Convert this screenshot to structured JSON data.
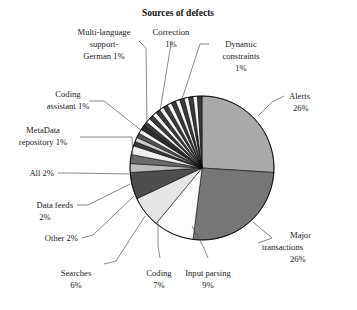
{
  "chart_data": {
    "type": "pie",
    "title": "Sources of defects",
    "subtitle": "",
    "xlabel": "",
    "ylabel": "",
    "legend_position": "none",
    "grid": false,
    "value_unit": "%",
    "start_angle_deg": 0,
    "direction": "clockwise",
    "labels": [
      "Alerts",
      "Major transactions",
      "Input parsing",
      "Coding",
      "Searches",
      "Other",
      "Data feeds",
      "All",
      "MetaData repository",
      "Coding assistant",
      "Multi-language support-German",
      "Correction",
      "Dynamic constraints"
    ],
    "values": [
      26,
      26,
      9,
      7,
      6,
      2,
      2,
      2,
      1,
      1,
      1,
      1,
      1
    ],
    "slices": [
      {
        "label": "Alerts",
        "value": 26,
        "display": "Alerts\n26%",
        "color": "#a9a9a9"
      },
      {
        "label": "Major transactions",
        "value": 26,
        "display": "Major\ntransactions\n26%",
        "color": "#767676"
      },
      {
        "label": "Input parsing",
        "value": 9,
        "display": "Input parsing\n9%",
        "color": "#fdfdfd"
      },
      {
        "label": "Coding",
        "value": 7,
        "display": "Coding\n7%",
        "color": "#e6e6e6"
      },
      {
        "label": "Searches",
        "value": 6,
        "display": "Searches\n6%",
        "color": "#4e4e4e"
      },
      {
        "label": "Other",
        "value": 2,
        "display": "Other 2%",
        "color": "#bdbdbd"
      },
      {
        "label": "Data feeds",
        "value": 2,
        "display": "Data feeds\n2%",
        "color": "#6b6b6b"
      },
      {
        "label": "All",
        "value": 2,
        "display": "All 2%",
        "color": "#efefef"
      },
      {
        "label": "MetaData repository",
        "value": 1,
        "display": "MetaData\nrepository 1%",
        "color": "#3a3a3a"
      },
      {
        "label": "Coding assistant",
        "value": 1,
        "display": "Coding\nassistant 1%",
        "color": "#cfcfcf"
      },
      {
        "label": "Multi-language support-German",
        "value": 1,
        "display": "Multi-language\nsupport-\nGerman 1%",
        "color": "#555555"
      },
      {
        "label": "Correction",
        "value": 1,
        "display": "Correction\n1%",
        "color": "#f2f2f2"
      },
      {
        "label": "Dynamic constraints",
        "value": 1,
        "display": "Dynamic\nconstraints\n1%",
        "color": "#2e2e2e"
      }
    ],
    "unlabeled_remainder": {
      "total": 15,
      "note": "thin alternating wedges between Dynamic constraints and Alerts",
      "count": 15,
      "value_each": 1
    },
    "palette": {
      "alerts": "#a9a9a9",
      "major_transactions": "#767676",
      "input_parsing": "#fdfdfd",
      "coding": "#e6e6e6",
      "searches": "#4e4e4e",
      "outline": "#000000",
      "leader_line": "#555555",
      "text": "#1a1a1a",
      "background": "#ffffff"
    }
  },
  "labels": {
    "title": "Sources of defects",
    "alerts_l1": "Alerts",
    "alerts_l2": "26%",
    "major_l1": "Major",
    "major_l2": "transactions",
    "major_l3": "26%",
    "input_parsing_l1": "Input parsing",
    "input_parsing_l2": "9%",
    "coding_l1": "Coding",
    "coding_l2": "7%",
    "searches_l1": "Searches",
    "searches_l2": "6%",
    "other_l1": "Other 2%",
    "data_feeds_l1": "Data feeds",
    "data_feeds_l2": "2%",
    "all_l1": "All 2%",
    "metadata_l1": "MetaData",
    "metadata_l2": "repository 1%",
    "coding_assistant_l1": "Coding",
    "coding_assistant_l2": "assistant 1%",
    "multilang_l1": "Multi-language",
    "multilang_l2": "support-",
    "multilang_l3": "German 1%",
    "correction_l1": "Correction",
    "correction_l2": "1%",
    "dynamic_l1": "Dynamic",
    "dynamic_l2": "constraints",
    "dynamic_l3": "1%"
  }
}
